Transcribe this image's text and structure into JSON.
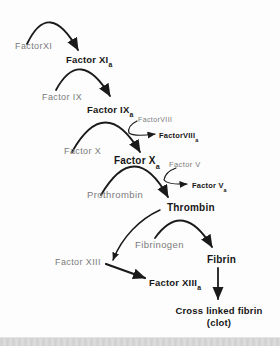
{
  "diagram_type": "flowchart-cascade",
  "nodes": {
    "factor_xi": {
      "label": "FactorXI",
      "state": "inactive"
    },
    "factor_xia": {
      "label": "Factor XI",
      "sub": "a",
      "state": "active"
    },
    "factor_ix": {
      "label": "Factor IX",
      "state": "inactive"
    },
    "factor_ixa": {
      "label": "Factor IX",
      "sub": "a",
      "state": "active"
    },
    "factor_viii": {
      "label": "FactorVIII",
      "state": "inactive"
    },
    "factor_viiia": {
      "label": "FactorVIII",
      "sub": "a",
      "state": "active"
    },
    "factor_x": {
      "label": "Factor X",
      "state": "inactive"
    },
    "factor_xa": {
      "label": "Factor X",
      "sub": "a",
      "state": "active"
    },
    "factor_v": {
      "label": "Factor V",
      "state": "inactive"
    },
    "factor_va": {
      "label": "Factor V",
      "sub": "a",
      "state": "active"
    },
    "prothrombin": {
      "label": "Prothrombin",
      "state": "inactive"
    },
    "thrombin": {
      "label": "Thrombin",
      "state": "active"
    },
    "fibrinogen": {
      "label": "Fibrinogen",
      "state": "inactive"
    },
    "fibrin": {
      "label": "Fibrin",
      "state": "active"
    },
    "factor_xiii": {
      "label": "Factor XIII",
      "state": "inactive"
    },
    "factor_xiiia": {
      "label": "Factor XIII",
      "sub": "a",
      "state": "active"
    },
    "cross_linked_fibrin": {
      "label": "Cross linked fibrin",
      "label2": "(clot)",
      "state": "active"
    }
  },
  "connections": [
    {
      "from": "FactorXI",
      "to": "Factor XIa",
      "style": "curved-hump"
    },
    {
      "from": "Factor IX",
      "to": "Factor IXa",
      "style": "curved-hump"
    },
    {
      "from": "FactorVIII",
      "to": "FactorVIIIa",
      "style": "small-branch"
    },
    {
      "from": "Factor X",
      "to": "Factor Xa",
      "style": "curved-hump"
    },
    {
      "from": "Factor V",
      "to": "Factor Va",
      "style": "small-branch"
    },
    {
      "from": "Prothrombin",
      "to": "Thrombin",
      "style": "curved-hump"
    },
    {
      "from": "Thrombin",
      "to": "Factor XIII",
      "style": "curved-thin"
    },
    {
      "from": "Fibrinogen",
      "to": "Fibrin",
      "style": "curved-hump"
    },
    {
      "from": "Factor XIII",
      "to": "Factor XIIIa",
      "style": "straight-thick"
    },
    {
      "from": "Fibrin",
      "to": "Cross linked fibrin (clot)",
      "style": "straight-down"
    }
  ],
  "colors": {
    "inactive_text": "#7b7b7b",
    "active_text": "#161616",
    "arrow": "#1a1a1a",
    "background": "#fdfdfd",
    "footer_bar": "#d6d6d6"
  }
}
